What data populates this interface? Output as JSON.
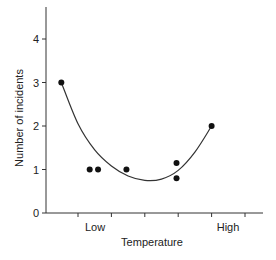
{
  "chart_data": {
    "type": "scatter",
    "title": "",
    "xlabel": "Temperature",
    "ylabel": "Number of incidents",
    "x_tick_labels": [
      {
        "label": "Low",
        "position": 0.5
      },
      {
        "label": "High",
        "position": 4.5
      }
    ],
    "x_ticks": [
      1,
      2,
      3,
      4,
      5,
      6
    ],
    "y_ticks": [
      0,
      1,
      2,
      3,
      4
    ],
    "ylim": [
      0,
      4.8
    ],
    "xlim": [
      0,
      6.5
    ],
    "grid": false,
    "legend": null,
    "points": [
      {
        "x": 0.5,
        "y": 3
      },
      {
        "x": 1.35,
        "y": 1
      },
      {
        "x": 1.6,
        "y": 1
      },
      {
        "x": 2.45,
        "y": 1
      },
      {
        "x": 3.95,
        "y": 1.15
      },
      {
        "x": 3.95,
        "y": 0.8
      },
      {
        "x": 5.0,
        "y": 2
      }
    ],
    "fit_curve": {
      "type": "quadratic",
      "description": "U-shaped fitted curve through the data",
      "points": [
        {
          "x": 0.5,
          "y": 3.0
        },
        {
          "x": 1.0,
          "y": 2.05
        },
        {
          "x": 1.5,
          "y": 1.45
        },
        {
          "x": 2.0,
          "y": 1.08
        },
        {
          "x": 2.5,
          "y": 0.85
        },
        {
          "x": 3.0,
          "y": 0.75
        },
        {
          "x": 3.5,
          "y": 0.78
        },
        {
          "x": 4.0,
          "y": 0.98
        },
        {
          "x": 4.5,
          "y": 1.4
        },
        {
          "x": 5.0,
          "y": 2.0
        }
      ]
    }
  },
  "colors": {
    "axis": "#333333",
    "points": "#111111",
    "curve": "#333333"
  }
}
